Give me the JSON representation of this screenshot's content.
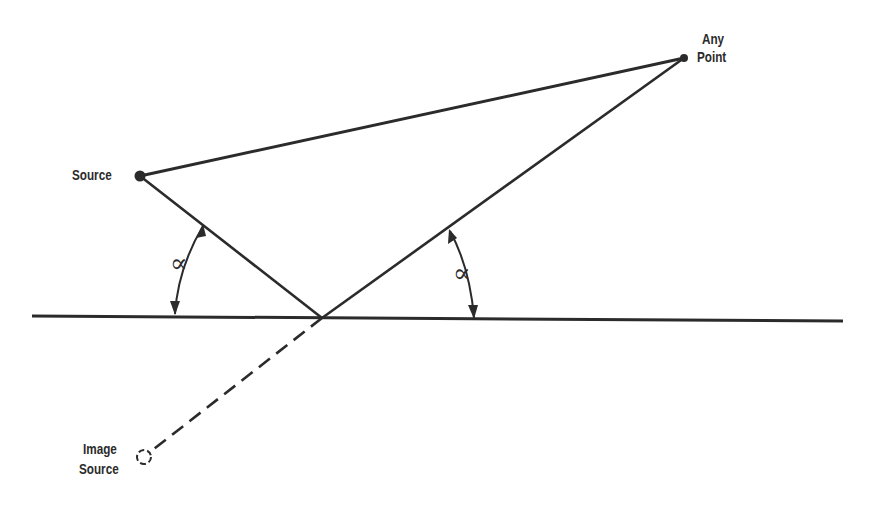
{
  "diagram": {
    "type": "reflection-geometry",
    "labels": {
      "source": "Source",
      "any_point_line1": "Any",
      "any_point_line2": "Point",
      "image_source_line1": "Image",
      "image_source_line2": "Source",
      "angle_left": "∝",
      "angle_right": "∝"
    },
    "points": {
      "source": {
        "x": 140,
        "y": 176
      },
      "any_point": {
        "x": 684,
        "y": 58
      },
      "reflection_point": {
        "x": 322,
        "y": 318
      },
      "image_source": {
        "x": 144,
        "y": 457
      }
    },
    "colors": {
      "stroke": "#2b2b2b",
      "background": "#ffffff"
    }
  }
}
